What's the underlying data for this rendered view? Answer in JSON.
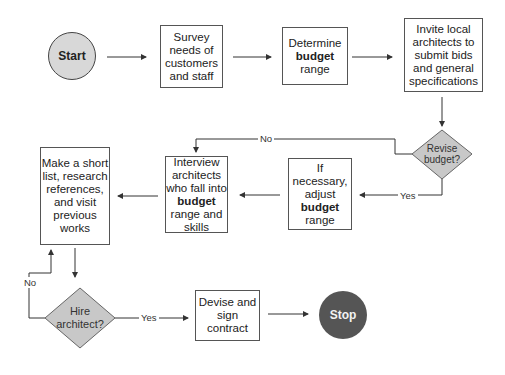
{
  "diagram": {
    "type": "flowchart",
    "nodes": {
      "start": {
        "label": "Start",
        "shape": "circle"
      },
      "survey": {
        "lines": [
          "Survey",
          "needs of",
          "customers",
          "and staff"
        ],
        "shape": "box"
      },
      "determine": {
        "l1": "Determine",
        "bold": "budget",
        "l3": "range",
        "shape": "box"
      },
      "invite": {
        "lines": [
          "Invite local",
          "architects to",
          "submit bids",
          "and general",
          "specifications"
        ],
        "shape": "box"
      },
      "revise": {
        "l1": "Revise",
        "l2": "budget?",
        "shape": "diamond"
      },
      "adjust": {
        "l1": "If",
        "l2": "necessary,",
        "l3": "adjust",
        "bold": "budget",
        "l5": "range",
        "shape": "box"
      },
      "interview": {
        "l1": "Interview",
        "l2": "architects",
        "l3": "who fall into",
        "bold": "budget",
        "l5": "range and",
        "l6": "skills",
        "shape": "box"
      },
      "shortlist": {
        "lines": [
          "Make a short",
          "list, research",
          "references,",
          "and visit",
          "previous",
          "works"
        ],
        "shape": "box"
      },
      "hire": {
        "l1": "Hire",
        "l2": "architect?",
        "shape": "diamond"
      },
      "devise": {
        "lines": [
          "Devise and",
          "sign",
          "contract"
        ],
        "shape": "box"
      },
      "stop": {
        "label": "Stop",
        "shape": "circle"
      }
    },
    "edge_labels": {
      "revise_no": "No",
      "revise_yes": "Yes",
      "hire_no": "No",
      "hire_yes": "Yes"
    },
    "colors": {
      "start_fill": "#d8d8d8",
      "stop_fill": "#555555",
      "diamond_fill": "#c8c8c8",
      "line": "#333333"
    }
  }
}
